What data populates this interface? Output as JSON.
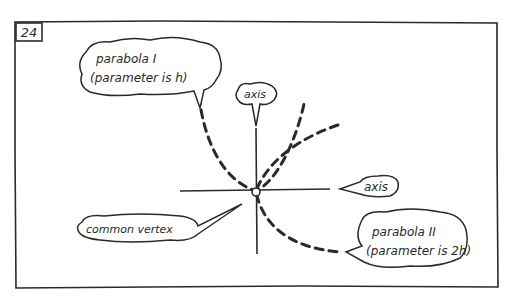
{
  "figure": {
    "number": "24",
    "ink_color": "#2a2a2a",
    "background": "#ffffff"
  },
  "labels": {
    "parabola_1": {
      "line1": "parabola I",
      "line2": "(parameter is h)"
    },
    "parabola_2": {
      "line1": "parabola II",
      "line2": "(parameter is 2h)"
    },
    "vertical_axis": "axis",
    "horizontal_axis": "axis",
    "vertex": "common vertex"
  },
  "diagram": {
    "elements": [
      {
        "id": "parabola_1",
        "style": "dashed",
        "opens": "up",
        "parameter": "h"
      },
      {
        "id": "parabola_2",
        "style": "dashed",
        "opens": "right",
        "parameter": "2h"
      },
      {
        "id": "vertical_axis",
        "style": "solid"
      },
      {
        "id": "horizontal_axis",
        "style": "solid"
      },
      {
        "id": "common_vertex",
        "shape": "small circle"
      }
    ]
  }
}
